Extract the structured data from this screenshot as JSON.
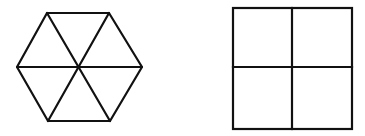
{
  "figure": {
    "background": "#ffffff",
    "stroke_color": "#111111",
    "stroke_width": 2.2,
    "shapes": [
      {
        "name": "hexagon",
        "description": "Regular hexagon divided into 6 triangles by 3 diagonals through the center",
        "vertices": [
          [
            47,
            13
          ],
          [
            109,
            13
          ],
          [
            142,
            67
          ],
          [
            110,
            121
          ],
          [
            48,
            121
          ],
          [
            17,
            67
          ]
        ],
        "center": [
          79,
          67
        ],
        "pieces": 6
      },
      {
        "name": "square",
        "description": "Square divided into 4 equal smaller squares",
        "x": 233,
        "y": 8,
        "width": 119,
        "height": 121,
        "divider_x": 292,
        "divider_y": 67,
        "pieces": 4
      }
    ]
  }
}
